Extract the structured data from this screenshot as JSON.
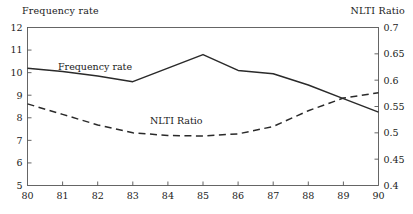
{
  "header": {
    "left_axis_title": "Frequency rate",
    "right_axis_title": "NLTI Ratio"
  },
  "annotations": {
    "series1_inline": "Frequency rate",
    "series2_inline": "NLTI Ratio"
  },
  "chart_data": {
    "type": "line",
    "title": "",
    "xlabel": "",
    "ylabel": "Frequency rate",
    "y2label": "NLTI Ratio",
    "x": [
      80,
      81,
      82,
      83,
      84,
      85,
      86,
      87,
      88,
      89,
      90
    ],
    "xtick_labels": [
      "80",
      "81",
      "82",
      "83",
      "84",
      "85",
      "86",
      "87",
      "88",
      "89",
      "90"
    ],
    "xlim": [
      80,
      90
    ],
    "ylim": [
      5,
      12
    ],
    "ytick_labels": [
      "5",
      "6",
      "7",
      "8",
      "9",
      "10",
      "11",
      "12"
    ],
    "ytick_values": [
      5,
      6,
      7,
      8,
      9,
      10,
      11,
      12
    ],
    "y2lim": [
      0.4,
      0.7
    ],
    "y2tick_labels": [
      "0.4",
      "0.45",
      "0.5",
      "0.55",
      "0.6",
      "0.65",
      "0.7"
    ],
    "y2tick_values": [
      0.4,
      0.45,
      0.5,
      0.55,
      0.6,
      0.65,
      0.7
    ],
    "grid": false,
    "legend_position": "inline-annotations",
    "series": [
      {
        "name": "Frequency rate",
        "axis": "left",
        "style": "solid",
        "color": "#2a2a2a",
        "values": [
          10.2,
          10.05,
          9.85,
          9.6,
          10.2,
          10.8,
          10.1,
          9.95,
          9.45,
          8.85,
          8.25
        ]
      },
      {
        "name": "NLTI Ratio",
        "axis": "right",
        "style": "dashed",
        "color": "#2a2a2a",
        "values": [
          0.555,
          0.535,
          0.515,
          0.5,
          0.495,
          0.494,
          0.498,
          0.512,
          0.542,
          0.566,
          0.576
        ]
      }
    ]
  }
}
